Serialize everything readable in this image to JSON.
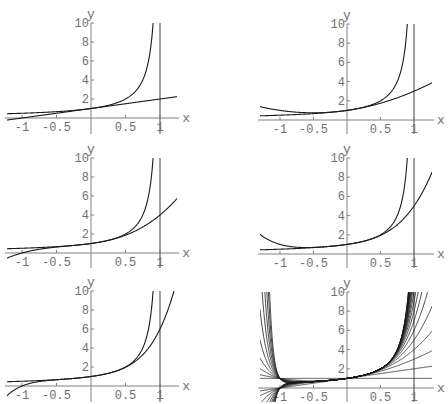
{
  "chart_data": [
    {
      "type": "line",
      "panel": "row1-left",
      "title": "",
      "xlabel": "x",
      "ylabel": "y",
      "xlim": [
        -1.2,
        1.25
      ],
      "ylim": [
        -0.3,
        10
      ],
      "x_ticks": [
        "-1",
        "-0.5",
        "0.5",
        "1"
      ],
      "y_ticks": [
        "2",
        "4",
        "6",
        "8",
        "10"
      ],
      "grid": false,
      "vertical_line_at_x": 1,
      "series": [
        {
          "name": "1/(1-x)",
          "function": "1/(1-x)"
        },
        {
          "name": "Taylor polynomial order 1",
          "order": 1,
          "value_at_x1": 2
        }
      ]
    },
    {
      "type": "line",
      "panel": "row1-right",
      "xlabel": "x",
      "ylabel": "y",
      "xlim": [
        -1.3,
        1.25
      ],
      "ylim": [
        -0.3,
        10
      ],
      "x_ticks": [
        "-1",
        "-0.5",
        "0.5",
        "1"
      ],
      "y_ticks": [
        "2",
        "4",
        "6",
        "8",
        "10"
      ],
      "grid": false,
      "vertical_line_at_x": 1,
      "series": [
        {
          "name": "1/(1-x)",
          "function": "1/(1-x)"
        },
        {
          "name": "Taylor polynomial order 2",
          "order": 2,
          "value_at_x1": 3
        }
      ]
    },
    {
      "type": "line",
      "panel": "row2-left",
      "xlabel": "x",
      "ylabel": "y",
      "xlim": [
        -1.2,
        1.25
      ],
      "ylim": [
        -0.3,
        10
      ],
      "x_ticks": [
        "-1",
        "-0.5",
        "0.5",
        "1"
      ],
      "y_ticks": [
        "2",
        "4",
        "6",
        "8",
        "10"
      ],
      "grid": false,
      "vertical_line_at_x": 1,
      "series": [
        {
          "name": "1/(1-x)",
          "function": "1/(1-x)"
        },
        {
          "name": "Taylor polynomial order 3",
          "order": 3,
          "value_at_x1": 4
        }
      ]
    },
    {
      "type": "line",
      "panel": "row2-right",
      "xlabel": "x",
      "ylabel": "y",
      "xlim": [
        -1.3,
        1.25
      ],
      "ylim": [
        -0.3,
        10
      ],
      "x_ticks": [
        "-1",
        "-0.5",
        "0.5",
        "1"
      ],
      "y_ticks": [
        "2",
        "4",
        "6",
        "8",
        "10"
      ],
      "grid": false,
      "vertical_line_at_x": 1,
      "series": [
        {
          "name": "1/(1-x)",
          "function": "1/(1-x)"
        },
        {
          "name": "Taylor polynomial order 4",
          "order": 4,
          "value_at_x1": 5
        }
      ]
    },
    {
      "type": "line",
      "panel": "row3-left",
      "xlabel": "x",
      "ylabel": "y",
      "xlim": [
        -1.2,
        1.25
      ],
      "ylim": [
        -0.3,
        10
      ],
      "x_ticks": [
        "-1",
        "-0.5",
        "0.5",
        "1"
      ],
      "y_ticks": [
        "2",
        "4",
        "6",
        "8",
        "10"
      ],
      "grid": false,
      "vertical_line_at_x": 1,
      "series": [
        {
          "name": "1/(1-x)",
          "function": "1/(1-x)"
        },
        {
          "name": "Taylor polynomial order 5",
          "order": 5,
          "value_at_x1": 6
        }
      ]
    },
    {
      "type": "line",
      "panel": "row3-right",
      "xlabel": "x",
      "ylabel": "y",
      "xlim": [
        -1.3,
        1.25
      ],
      "ylim": [
        -0.3,
        10
      ],
      "x_ticks": [
        "-1",
        "-0.5",
        "0.5",
        "1"
      ],
      "y_ticks": [
        "2",
        "4",
        "6",
        "8",
        "10"
      ],
      "grid": false,
      "vertical_line_at_x": 1,
      "series": [
        {
          "name": "Taylor polynomials orders 0-20",
          "orders": [
            0,
            1,
            2,
            3,
            4,
            5,
            6,
            7,
            8,
            9,
            10,
            11,
            12,
            13,
            14,
            15,
            16,
            17,
            18,
            19,
            20
          ]
        }
      ]
    }
  ],
  "labels": {
    "x_axis": "x",
    "y_axis": "y",
    "x_ticks": [
      {
        "value": -1,
        "label": "-1"
      },
      {
        "value": -0.5,
        "label": "-0.5"
      },
      {
        "value": 0.5,
        "label": "0.5"
      },
      {
        "value": 1,
        "label": "1"
      }
    ],
    "y_ticks": [
      {
        "value": 2,
        "label": "2"
      },
      {
        "value": 4,
        "label": "4"
      },
      {
        "value": 6,
        "label": "6"
      },
      {
        "value": 8,
        "label": "8"
      },
      {
        "value": 10,
        "label": "10"
      }
    ]
  },
  "layout": {
    "panels": [
      {
        "id": "p1",
        "left": 0,
        "top": 0,
        "x0": 91,
        "y0": 118,
        "xunit": 69,
        "yunit": 9.5,
        "xmin": -1.22,
        "xmax": 1.25,
        "series_ref": 0
      },
      {
        "id": "p2",
        "left": 224,
        "top": 0,
        "x0": 123,
        "y0": 120,
        "xunit": 67,
        "yunit": 9.6,
        "xmin": -1.3,
        "xmax": 1.27,
        "series_ref": 1
      },
      {
        "id": "p3",
        "left": 0,
        "top": 134,
        "x0": 91,
        "y0": 119,
        "xunit": 69,
        "yunit": 9.5,
        "xmin": -1.22,
        "xmax": 1.25,
        "series_ref": 2
      },
      {
        "id": "p4",
        "left": 224,
        "top": 134,
        "x0": 123,
        "y0": 120,
        "xunit": 67,
        "yunit": 9.6,
        "xmin": -1.3,
        "xmax": 1.27,
        "series_ref": 3
      },
      {
        "id": "p5",
        "left": 0,
        "top": 268,
        "x0": 91,
        "y0": 118,
        "xunit": 69,
        "yunit": 9.5,
        "xmin": -1.22,
        "xmax": 1.25,
        "series_ref": 4
      },
      {
        "id": "p6",
        "left": 224,
        "top": 268,
        "x0": 123,
        "y0": 120,
        "xunit": 67,
        "yunit": 9.6,
        "xmin": -1.3,
        "xmax": 1.27,
        "series_ref": 5
      }
    ]
  }
}
